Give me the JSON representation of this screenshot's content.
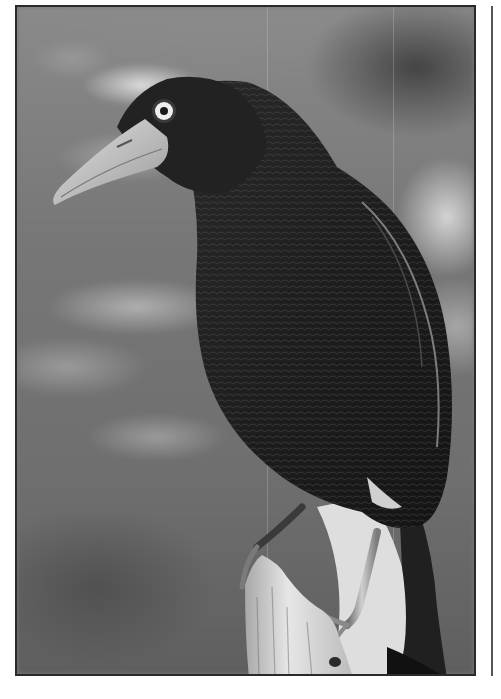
{
  "image": {
    "subject": "Grayscale photograph of a dark crow-like bird with a pale eye and large pale bill, perched on a weathered wooden stump against a blurred foliage background",
    "style": "black-and-white photo with thin dark border frame",
    "colors": {
      "frame_border": "#2a2a2a",
      "side_line": "#555555",
      "background_mid": "#777777",
      "bird_body": "#1c1c1c",
      "bill": "#c8c8c8",
      "eye_ring": "#eeeeee",
      "stump": "#d8d8d8"
    },
    "elements": [
      {
        "name": "bird",
        "description": "dark feathered bird, facing left"
      },
      {
        "name": "bill",
        "description": "long pale curved bill"
      },
      {
        "name": "eye",
        "description": "pale iris with dark pupil"
      },
      {
        "name": "stump",
        "description": "pale weathered wooden perch at bottom center"
      },
      {
        "name": "background",
        "description": "out-of-focus leaves"
      }
    ]
  }
}
